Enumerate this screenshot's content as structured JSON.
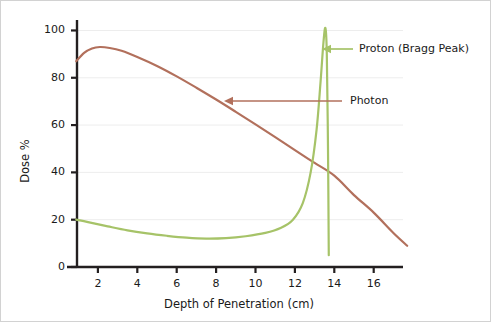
{
  "chart_data": {
    "type": "line",
    "title": "",
    "xlabel": "Depth of Penetration (cm)",
    "ylabel": "Dose %",
    "xlim": [
      0,
      18.5
    ],
    "ylim": [
      0,
      104
    ],
    "xticks": [
      "2",
      "4",
      "6",
      "8",
      "10",
      "12",
      "14",
      "16"
    ],
    "xtick_values": [
      2,
      4,
      6,
      8,
      10,
      12,
      14,
      16
    ],
    "yticks": [
      "0",
      "20",
      "40",
      "60",
      "80",
      "100"
    ],
    "ytick_values": [
      0,
      20,
      40,
      60,
      80,
      100
    ],
    "grid": "horizontal",
    "legend_position": "inline-annotations",
    "series": [
      {
        "name": "Photon",
        "color": "#b2705c",
        "x": [
          0.9,
          1.3,
          1.7,
          2.1,
          2.6,
          3.2,
          4.0,
          5.0,
          6.0,
          7.0,
          8.0,
          9.0,
          10.0,
          11.0,
          12.0,
          13.0,
          14.0,
          15.0,
          16.0,
          17.0,
          17.7
        ],
        "values": [
          87.0,
          90.5,
          92.4,
          93.0,
          92.6,
          91.4,
          88.8,
          85.0,
          80.6,
          75.8,
          70.8,
          65.6,
          60.3,
          54.9,
          49.4,
          44.0,
          38.6,
          30.4,
          23.0,
          14.4,
          9.0
        ]
      },
      {
        "name": "Proton (Bragg Peak)",
        "color": "#a6c368",
        "x": [
          0.9,
          1.5,
          2.5,
          3.5,
          4.5,
          5.5,
          6.5,
          7.5,
          8.5,
          9.5,
          10.5,
          11.3,
          11.9,
          12.4,
          12.8,
          13.1,
          13.3,
          13.45,
          13.55,
          13.62,
          13.68,
          13.72
        ],
        "values": [
          20.0,
          19.0,
          17.2,
          15.5,
          14.2,
          13.2,
          12.4,
          12.0,
          12.2,
          13.0,
          14.4,
          16.6,
          20.0,
          27.0,
          40.0,
          58.0,
          78.0,
          95.0,
          101.0,
          90.0,
          50.0,
          5.0
        ]
      }
    ],
    "annotations": [
      {
        "name": "proton-annotation",
        "label": "Proton (Bragg Peak)",
        "color": "#a6c368",
        "arrow_from_x": 352,
        "arrow_to_x": 321,
        "arrow_y": 48,
        "text_x": 358,
        "text_y": 48
      },
      {
        "name": "photon-annotation",
        "label": "Photon",
        "color": "#b2705c",
        "arrow_from_x": 341,
        "arrow_to_x": 223,
        "arrow_y": 100,
        "text_x": 349,
        "text_y": 100
      }
    ],
    "axis_geometry": {
      "left_px": 76,
      "right_px": 400,
      "top_px": 20,
      "bottom_px": 266,
      "x_origin_px": 57.5,
      "x_per_unit_px": 19.7
    },
    "colors": {
      "axis": "#231f20",
      "grid": "#ededed",
      "text": "#1a1a1a",
      "background": "#ffffff",
      "border": "#d2d2d2"
    }
  }
}
